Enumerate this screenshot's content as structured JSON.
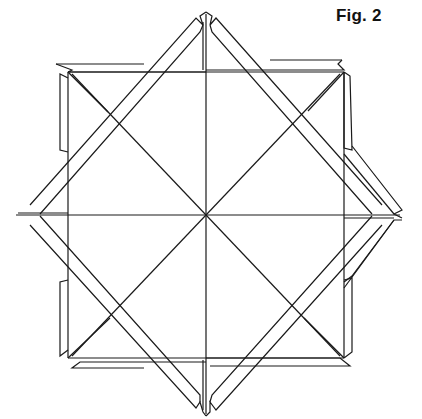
{
  "figure": {
    "label": "Fig. 2",
    "stroke_color": "#1a1a1a",
    "background_color": "#ffffff",
    "center": [
      206,
      215
    ]
  },
  "geometry": {
    "square_axis_aligned": [
      [
        68,
        70
      ],
      [
        344,
        70
      ],
      [
        344,
        360
      ],
      [
        68,
        360
      ]
    ],
    "square_rotated_tips": {
      "top": [
        206,
        12
      ],
      "right": [
        402,
        215
      ],
      "bottom": [
        206,
        415
      ],
      "left": [
        12,
        215
      ]
    },
    "spokes": [
      [
        [
          206,
          15
        ],
        [
          206,
          415
        ]
      ],
      [
        [
          14,
          215
        ],
        [
          400,
          215
        ]
      ],
      [
        [
          68,
          70
        ],
        [
          344,
          360
        ]
      ],
      [
        [
          344,
          70
        ],
        [
          68,
          360
        ]
      ]
    ],
    "outlines": [
      [
        [
          68,
          70
        ],
        [
          206,
          70
        ],
        [
          206,
          15
        ],
        [
          68,
          70
        ]
      ],
      [
        [
          206,
          70
        ],
        [
          344,
          70
        ],
        [
          206,
          15
        ]
      ],
      [
        [
          344,
          70
        ],
        [
          344,
          215
        ],
        [
          400,
          215
        ]
      ],
      [
        [
          344,
          215
        ],
        [
          344,
          360
        ],
        [
          400,
          215
        ]
      ],
      [
        [
          344,
          360
        ],
        [
          206,
          360
        ],
        [
          206,
          415
        ]
      ],
      [
        [
          206,
          360
        ],
        [
          68,
          360
        ],
        [
          206,
          415
        ]
      ],
      [
        [
          68,
          360
        ],
        [
          68,
          215
        ],
        [
          14,
          215
        ]
      ],
      [
        [
          68,
          215
        ],
        [
          68,
          70
        ],
        [
          14,
          215
        ]
      ]
    ],
    "strips": [
      [
        [
          64,
          74
        ],
        [
          196,
          20
        ],
        [
          204,
          17
        ],
        [
          202,
          26
        ],
        [
          72,
          74
        ]
      ],
      [
        [
          208,
          17
        ],
        [
          216,
          20
        ],
        [
          348,
          66
        ],
        [
          344,
          74
        ]
      ],
      [
        [
          60,
          66
        ],
        [
          196,
          66
        ],
        [
          206,
          70
        ],
        [
          70,
          70
        ]
      ],
      [
        [
          214,
          66
        ],
        [
          340,
          66
        ],
        [
          344,
          70
        ],
        [
          206,
          70
        ]
      ],
      [
        [
          348,
          80
        ],
        [
          350,
          210
        ],
        [
          402,
          217
        ],
        [
          348,
          226
        ]
      ],
      [
        [
          348,
          222
        ],
        [
          404,
          215
        ],
        [
          352,
          354
        ],
        [
          348,
          356
        ]
      ],
      [
        [
          350,
          366
        ],
        [
          216,
          366
        ],
        [
          206,
          360
        ],
        [
          344,
          360
        ]
      ],
      [
        [
          196,
          366
        ],
        [
          60,
          366
        ],
        [
          68,
          360
        ],
        [
          206,
          360
        ]
      ],
      [
        [
          206,
          415
        ],
        [
          340,
          360
        ]
      ],
      [
        [
          64,
          356
        ],
        [
          62,
          222
        ],
        [
          10,
          214
        ],
        [
          64,
          206
        ]
      ],
      [
        [
          62,
          208
        ],
        [
          8,
          216
        ],
        [
          60,
          76
        ],
        [
          64,
          74
        ]
      ]
    ]
  }
}
